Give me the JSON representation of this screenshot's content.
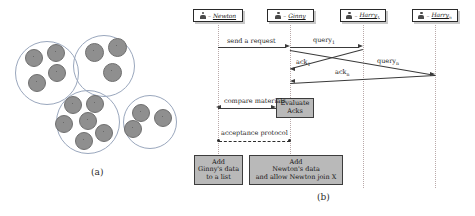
{
  "figure": {
    "panel_a": {
      "caption": "(a)",
      "clusters": [
        {
          "id": "cluster-1",
          "cx": 47,
          "cy": 73,
          "r": 32,
          "dots": [
            {
              "x": 34,
              "y": 58,
              "r": 9
            },
            {
              "x": 56,
              "y": 53,
              "r": 9
            },
            {
              "x": 57,
              "y": 73,
              "r": 9
            },
            {
              "x": 37,
              "y": 83,
              "r": 9
            }
          ]
        },
        {
          "id": "cluster-2",
          "cx": 104,
          "cy": 66,
          "r": 31,
          "dots": [
            {
              "x": 95,
              "y": 53,
              "r": 9.5
            },
            {
              "x": 118,
              "y": 48,
              "r": 9.5
            },
            {
              "x": 113,
              "y": 73,
              "r": 9.5
            }
          ]
        },
        {
          "id": "cluster-3",
          "cx": 88,
          "cy": 122,
          "r": 32,
          "dots": [
            {
              "x": 73,
              "y": 105,
              "r": 9
            },
            {
              "x": 95,
              "y": 104,
              "r": 9
            },
            {
              "x": 64,
              "y": 124,
              "r": 9
            },
            {
              "x": 88,
              "y": 121,
              "r": 9
            },
            {
              "x": 84,
              "y": 141,
              "r": 9
            },
            {
              "x": 104,
              "y": 133,
              "r": 9
            }
          ]
        },
        {
          "id": "cluster-4",
          "cx": 150,
          "cy": 122,
          "r": 27,
          "dots": [
            {
              "x": 141,
              "y": 113,
              "r": 9
            },
            {
              "x": 163,
              "y": 118,
              "r": 9
            },
            {
              "x": 133,
              "y": 129,
              "r": 9
            }
          ]
        }
      ]
    },
    "panel_b": {
      "caption": "(b)",
      "actors": [
        {
          "id": "newton",
          "label": "Newton",
          "subscript": "",
          "x": 33
        },
        {
          "id": "ginny",
          "label": "Ginny",
          "subscript": "",
          "x": 105
        },
        {
          "id": "harry1",
          "label": "Harry",
          "subscript": "1",
          "x": 178
        },
        {
          "id": "harryn",
          "label": "Harry",
          "subscript": "n",
          "x": 250
        }
      ],
      "messages": [
        {
          "id": "send-a-request",
          "label": "send a request",
          "subscript": "",
          "from": "newton",
          "to": "ginny",
          "kind": "solid-arrow"
        },
        {
          "id": "query-1",
          "label": "query",
          "subscript": "1",
          "from": "ginny",
          "to": "harry1",
          "kind": "solid-arrow"
        },
        {
          "id": "query-n",
          "label": "query",
          "subscript": "n",
          "from": "ginny",
          "to": "harryn",
          "kind": "solid-arrow"
        },
        {
          "id": "ack-1",
          "label": "ack",
          "subscript": "1",
          "from": "harry1",
          "to": "ginny",
          "kind": "solid-arrow"
        },
        {
          "id": "ack-n",
          "label": "ack",
          "subscript": "n",
          "from": "harryn",
          "to": "ginny",
          "kind": "solid-arrow"
        },
        {
          "id": "compare-materials",
          "label": "compare materials",
          "subscript": "",
          "from": "ginny",
          "to": "newton",
          "kind": "solid-arrow-both"
        },
        {
          "id": "acceptance-protocol",
          "label": "acceptance protocol",
          "subscript": "",
          "from": "ginny",
          "to": "newton",
          "kind": "dashed-both"
        }
      ],
      "process_boxes": [
        {
          "id": "evaluate-acks",
          "lines": [
            "Evaluate",
            "Acks"
          ]
        },
        {
          "id": "add-ginny-data",
          "lines": [
            "Add",
            "Ginny's data",
            "to a list"
          ]
        },
        {
          "id": "add-newton-data",
          "lines": [
            "Add",
            "Newton's data",
            "and allow Newton join X"
          ]
        }
      ]
    },
    "colors": {
      "cluster_outline": "#9aa7bd",
      "dot_fill": "#8f8f8f",
      "box_fill": "#b9b9b9",
      "line": "#3a3a3a",
      "lifeline": "#b9a9a9"
    }
  }
}
